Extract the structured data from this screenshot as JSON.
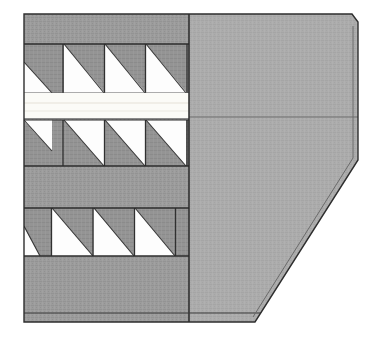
{
  "canvas": {
    "width": 378,
    "height": 338,
    "background_color": "#ffffff",
    "title": "Sectional Technical Drawing"
  },
  "palette": {
    "background": "#ffffff",
    "hatch_light_gray": "#a9a9a9",
    "hatch_mid_gray": "#9a9a9a",
    "hatch_dark_gray": "#8e8e8e",
    "outline_dark": "#2e2e2e",
    "outline_mid": "#4a4a4a",
    "seam_line": "#5a5a5a",
    "void_white": "#fdfdfd",
    "gap_white": "#fbfbf7"
  },
  "body_outline": {
    "label": "main-section-body",
    "points": "24,14 352,14 358,22 358,160 255,322 24,322",
    "left_x": 24,
    "top_y": 14,
    "right_x": 358,
    "bottom_y": 322,
    "top_right_chamfer": {
      "from_x": 352,
      "from_y": 14,
      "to_x": 358,
      "to_y": 22
    },
    "bottom_right_chamfer": {
      "from_x": 358,
      "from_y": 160,
      "to_x": 255,
      "to_y": 322
    },
    "stroke_width": 1.4
  },
  "regions": {
    "divider_x": 189,
    "left_serrated": {
      "label": "serrated-tooth-region",
      "x": 24,
      "width": 165,
      "fill": "#9a9a9a",
      "description": "three bands of right-triangle teeth"
    },
    "right_solid": {
      "label": "solid-hatch-region",
      "x": 189,
      "width": 169,
      "fill": "#a9a9a9",
      "seam_y": 117,
      "description": "plain hatched body with horizontal joint seam"
    }
  },
  "tooth_bands": [
    {
      "name": "band-upper",
      "top_y": 44,
      "bottom_y": 93,
      "pitch": 41,
      "phase_offset": -18,
      "orientation": "void-lower-right",
      "void_fill": "#fdfdfd",
      "solid_fill": "#9a9a9a"
    },
    {
      "name": "band-middle",
      "top_y": 120,
      "bottom_y": 166,
      "pitch": 41,
      "phase_offset": -18,
      "orientation": "void-upper-right",
      "void_fill": "#fdfdfd",
      "solid_fill": "#9a9a9a"
    },
    {
      "name": "band-lower",
      "top_y": 208,
      "bottom_y": 256,
      "pitch": 41,
      "phase_offset": -18,
      "orientation": "void-lower-left",
      "void_fill": "#fdfdfd",
      "solid_fill": "#9a9a9a"
    }
  ],
  "gap_strip": {
    "label": "inter-band-gap",
    "top_y": 93,
    "bottom_y": 119,
    "left_x": 24,
    "right_x": 189,
    "fill": "#fbfbf7"
  },
  "base_plate": {
    "label": "base-plate-seam",
    "seam_y": 313,
    "left_x": 24,
    "right_x": 272,
    "stroke": "#3a3a3a"
  }
}
